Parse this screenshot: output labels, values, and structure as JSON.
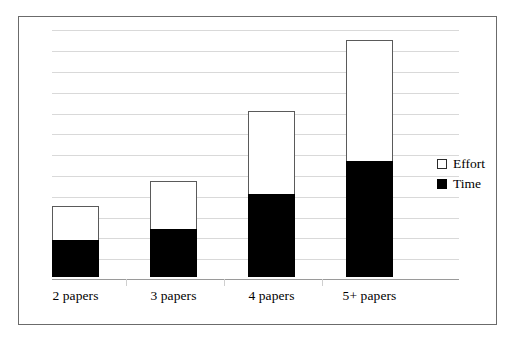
{
  "chart_data": {
    "type": "bar",
    "subtype": "stacked",
    "title": "",
    "xlabel": "",
    "ylabel": "",
    "categories": [
      "2 papers",
      "3 papers",
      "4 papers",
      "5+ papers"
    ],
    "series": [
      {
        "name": "Time",
        "color": "#000000",
        "values": [
          1.8,
          2.3,
          4.0,
          5.6
        ]
      },
      {
        "name": "Effort",
        "color": "#ffffff",
        "values": [
          1.6,
          2.3,
          4.0,
          5.8
        ]
      }
    ],
    "stack_order": [
      "Time",
      "Effort"
    ],
    "totals": [
      3.4,
      4.6,
      8.0,
      11.4
    ],
    "ylim": [
      0,
      12.6
    ],
    "y_tick_values": [
      1,
      2,
      3,
      4,
      5,
      6,
      7,
      8,
      9,
      10,
      11,
      12
    ],
    "y_tick_labels": [],
    "grid": true,
    "grid_axis": "y",
    "grid_color": "#d9d9d9",
    "legend_position": "right",
    "legend": [
      {
        "label": "Effort",
        "swatch": "hollow-square",
        "color": "#ffffff"
      },
      {
        "label": "Time",
        "swatch": "filled-square",
        "color": "#000000"
      }
    ],
    "axis_line_color": "#9a9a9a",
    "frame_border_color": "#6b6b6b",
    "bar_border_color": "#5a5a5a",
    "background": "#ffffff"
  },
  "legend": {
    "effort_label": "Effort",
    "time_label": "Time"
  },
  "categories": {
    "c0": "2 papers",
    "c1": "3 papers",
    "c2": "4 papers",
    "c3": "5+ papers"
  }
}
